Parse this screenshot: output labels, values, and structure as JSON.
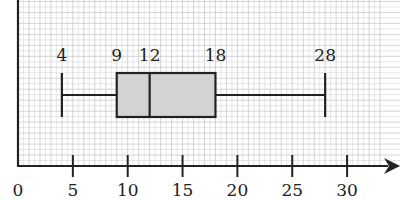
{
  "chart_data": {
    "type": "boxplot",
    "title": "",
    "xlabel": "",
    "ylabel": "",
    "xlim": [
      0,
      33
    ],
    "grid": true,
    "x_ticks": [
      0,
      5,
      10,
      15,
      20,
      25,
      30
    ],
    "tick_labels": [
      "0",
      "5",
      "10",
      "15",
      "20",
      "25",
      "30"
    ],
    "five_number_summary": {
      "min": 4,
      "q1": 9,
      "median": 12,
      "q3": 18,
      "max": 28
    },
    "annotations": [
      "4",
      "9",
      "12",
      "18",
      "28"
    ],
    "box_fill": "#d3d3d3",
    "line_color": "#222222",
    "grid_color": "#cfcfcf"
  }
}
